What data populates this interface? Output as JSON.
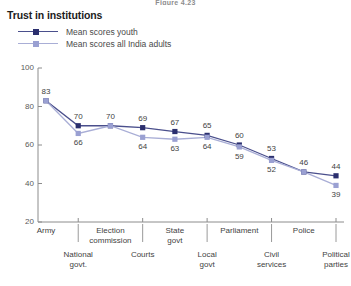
{
  "figure_caption": "Figure 4.23",
  "chart_title": "Trust in institutions",
  "legend": {
    "youth": {
      "label": "Mean scores youth",
      "color": "#2b2f6e",
      "line_color": "#4a4f8c",
      "marker": "square"
    },
    "adults": {
      "label": "Mean scores all India adults",
      "color": "#9aa0d2",
      "line_color": "#a9aed6",
      "marker": "square"
    }
  },
  "chart_data": {
    "type": "line",
    "title": "Trust in institutions",
    "xlabel": "",
    "ylabel": "",
    "ylim": [
      20,
      100
    ],
    "yticks": [
      20,
      40,
      60,
      80,
      100
    ],
    "grid": false,
    "legend_position": "top-left",
    "categories": [
      "Army",
      "National govt.",
      "Election commission",
      "Courts",
      "State govt",
      "Local govt",
      "Parliament",
      "Civil services",
      "Police",
      "Political parties"
    ],
    "category_tiers": {
      "upper": [
        "Army",
        "Election commission",
        "State govt",
        "Parliament",
        "Police"
      ],
      "lower": [
        "National govt.",
        "Courts",
        "Local govt",
        "Civil services",
        "Political parties"
      ]
    },
    "series": [
      {
        "name": "Mean scores youth",
        "color": "#2b2f6e",
        "values": [
          83,
          70,
          70,
          69,
          67,
          65,
          60,
          53,
          46,
          44
        ]
      },
      {
        "name": "Mean scores all India adults",
        "color": "#9aa0d2",
        "values": [
          83,
          66,
          70,
          64,
          63,
          64,
          59,
          52,
          46,
          39
        ]
      }
    ],
    "point_labels": {
      "youth": [
        "83",
        "70",
        "70",
        "69",
        "67",
        "65",
        "60",
        "53",
        "46",
        "44"
      ],
      "adults": [
        "",
        "66",
        "",
        "64",
        "63",
        "64",
        "59",
        "52",
        "",
        "39"
      ]
    }
  },
  "axis": {
    "ytick_labels": [
      "100",
      "80",
      "60",
      "40",
      "20"
    ]
  }
}
